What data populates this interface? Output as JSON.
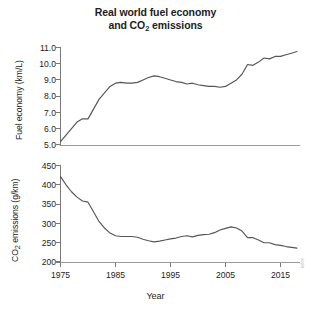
{
  "chart_data": {
    "type": "line",
    "title": "Real world fuel economy and CO2 emissions",
    "title_lines": [
      "Real world fuel economy",
      "and CO2 emissions"
    ],
    "xlabel": "Year",
    "xlim": [
      1975,
      2018
    ],
    "xticks": [
      1975,
      1985,
      1995,
      2005,
      2015
    ],
    "xticklabels": [
      "1975",
      "1985",
      "1995",
      "2005",
      "2015"
    ],
    "grid": false,
    "legend": "none",
    "panels": [
      {
        "id": "fuel-economy",
        "ylabel": "Fuel economy (km/L)",
        "ylim": [
          5.0,
          11.0
        ],
        "yticks": [
          5.0,
          6.0,
          7.0,
          8.0,
          9.0,
          10.0,
          11.0
        ],
        "yticklabels": [
          "5.0",
          "6.0",
          "7.0",
          "8.0",
          "9.0",
          "10.0",
          "11.0"
        ],
        "series": [
          {
            "name": "Fuel economy",
            "color": "#555555",
            "x": [
              1975,
              1976,
              1977,
              1978,
              1979,
              1980,
              1981,
              1982,
              1983,
              1984,
              1985,
              1986,
              1987,
              1988,
              1989,
              1990,
              1991,
              1992,
              1993,
              1994,
              1995,
              1996,
              1997,
              1998,
              1999,
              2000,
              2001,
              2002,
              2003,
              2004,
              2005,
              2006,
              2007,
              2008,
              2009,
              2010,
              2011,
              2012,
              2013,
              2014,
              2015,
              2016,
              2017,
              2018
            ],
            "values": [
              5.2,
              5.6,
              6.0,
              6.4,
              6.6,
              6.6,
              7.2,
              7.8,
              8.2,
              8.6,
              8.8,
              8.85,
              8.8,
              8.8,
              8.85,
              9.0,
              9.15,
              9.25,
              9.2,
              9.1,
              9.0,
              8.9,
              8.85,
              8.75,
              8.8,
              8.7,
              8.65,
              8.6,
              8.6,
              8.55,
              8.6,
              8.8,
              9.0,
              9.35,
              9.95,
              9.9,
              10.1,
              10.35,
              10.3,
              10.45,
              10.45,
              10.55,
              10.65,
              10.75
            ]
          }
        ]
      },
      {
        "id": "co2-emissions",
        "ylabel": "CO2 emissions (g/km)",
        "ylim": [
          200,
          450
        ],
        "yticks": [
          200,
          250,
          300,
          350,
          400,
          450
        ],
        "yticklabels": [
          "200",
          "250",
          "300",
          "350",
          "400",
          "450"
        ],
        "series": [
          {
            "name": "CO2 emissions",
            "color": "#555555",
            "x": [
              1975,
              1976,
              1977,
              1978,
              1979,
              1980,
              1981,
              1982,
              1983,
              1984,
              1985,
              1986,
              1987,
              1988,
              1989,
              1990,
              1991,
              1992,
              1993,
              1994,
              1995,
              1996,
              1997,
              1998,
              1999,
              2000,
              2001,
              2002,
              2003,
              2004,
              2005,
              2006,
              2007,
              2008,
              2009,
              2010,
              2011,
              2012,
              2013,
              2014,
              2015,
              2016,
              2017,
              2018
            ],
            "values": [
              421,
              400,
              382,
              368,
              358,
              355,
              330,
              305,
              288,
              275,
              268,
              266,
              266,
              266,
              264,
              259,
              255,
              252,
              254,
              257,
              260,
              262,
              266,
              268,
              265,
              269,
              271,
              272,
              276,
              283,
              287,
              291,
              288,
              280,
              263,
              263,
              257,
              250,
              250,
              245,
              243,
              240,
              238,
              236
            ]
          }
        ]
      }
    ]
  },
  "watermark": {
    "text": "ielts"
  }
}
